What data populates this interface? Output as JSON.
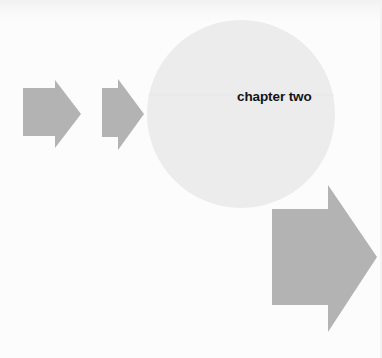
{
  "page": {
    "chapter_title": "chapter two"
  },
  "colors": {
    "background": "#fbfbfb",
    "circle": "#ececec",
    "arrow": "#b3b3b3",
    "text": "#141414"
  },
  "shapes": {
    "arrows": [
      {
        "name": "small-arrow-1",
        "size": "small"
      },
      {
        "name": "small-arrow-2",
        "size": "small"
      },
      {
        "name": "large-arrow",
        "size": "large"
      }
    ],
    "circle": {
      "name": "title-circle"
    }
  }
}
